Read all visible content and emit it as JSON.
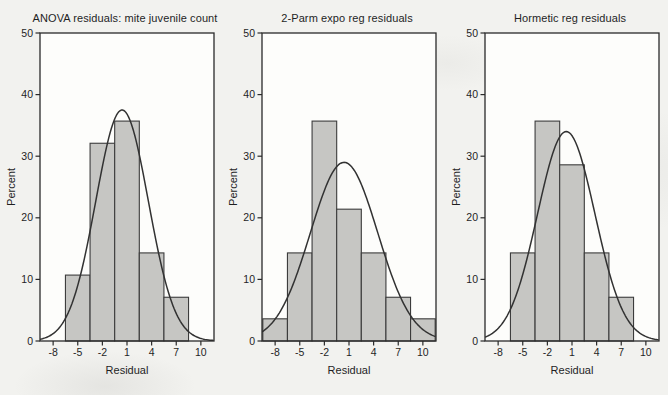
{
  "figure": {
    "background": "#f2f2ef"
  },
  "colors": {
    "plot_bg": "#fdfdfb",
    "bar_fill": "#c6c6c3",
    "bar_stroke": "#3c3c3c",
    "curve": "#323232",
    "axis": "#2a2a2a",
    "text": "#1f1f1f"
  },
  "chart_data": [
    {
      "type": "bar",
      "title": "ANOVA residuals: mite juvenile count",
      "xlabel": "Residual",
      "ylabel": "Percent",
      "xticks": [
        -8,
        -5,
        -2,
        1,
        4,
        7,
        10
      ],
      "yticks": [
        0,
        10,
        20,
        30,
        40,
        50
      ],
      "xlim": [
        -9.6,
        11.6
      ],
      "ylim": [
        0,
        50
      ],
      "bin_width": 3,
      "grid": false,
      "bars": [
        {
          "x": -5,
          "y": 10.7
        },
        {
          "x": -2,
          "y": 32.1
        },
        {
          "x": 1,
          "y": 35.7
        },
        {
          "x": 4,
          "y": 14.3
        },
        {
          "x": 7,
          "y": 7.1
        }
      ],
      "normal_curve": {
        "peak": 37.5,
        "mean": 0.4,
        "sigma": 3.2
      }
    },
    {
      "type": "bar",
      "title": "2-Parm expo reg residuals",
      "xlabel": "Residual",
      "ylabel": "Percent",
      "xticks": [
        -8,
        -5,
        -2,
        1,
        4,
        7,
        10
      ],
      "yticks": [
        0,
        10,
        20,
        30,
        40,
        50
      ],
      "xlim": [
        -9.6,
        11.6
      ],
      "ylim": [
        0,
        50
      ],
      "bin_width": 3,
      "grid": false,
      "bars": [
        {
          "x": -8,
          "y": 3.6
        },
        {
          "x": -5,
          "y": 14.3
        },
        {
          "x": -2,
          "y": 35.7
        },
        {
          "x": 1,
          "y": 21.4
        },
        {
          "x": 4,
          "y": 14.3
        },
        {
          "x": 7,
          "y": 7.1
        },
        {
          "x": 10,
          "y": 3.6
        }
      ],
      "normal_curve": {
        "peak": 29.0,
        "mean": 0.4,
        "sigma": 4.1
      }
    },
    {
      "type": "bar",
      "title": "Hormetic reg residuals",
      "xlabel": "Residual",
      "ylabel": "Percent",
      "xticks": [
        -8,
        -5,
        -2,
        1,
        4,
        7,
        10
      ],
      "yticks": [
        0,
        10,
        20,
        30,
        40,
        50
      ],
      "xlim": [
        -9.6,
        11.6
      ],
      "ylim": [
        0,
        50
      ],
      "bin_width": 3,
      "grid": false,
      "bars": [
        {
          "x": -5,
          "y": 14.3
        },
        {
          "x": -2,
          "y": 35.7
        },
        {
          "x": 1,
          "y": 28.6
        },
        {
          "x": 4,
          "y": 14.3
        },
        {
          "x": 7,
          "y": 7.1
        }
      ],
      "normal_curve": {
        "peak": 34.0,
        "mean": 0.3,
        "sigma": 3.5
      }
    }
  ]
}
